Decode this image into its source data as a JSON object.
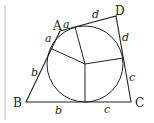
{
  "diagram": {
    "type": "tangential-quadrilateral",
    "vertices": {
      "A": "A",
      "B": "B",
      "C": "C",
      "D": "D"
    },
    "tangent_labels": {
      "a_top": "a",
      "a_left": "a",
      "b_left": "b",
      "b_bottom": "b",
      "c_bottom": "c",
      "c_right": "c",
      "d_top": "d",
      "d_right": "d"
    }
  }
}
